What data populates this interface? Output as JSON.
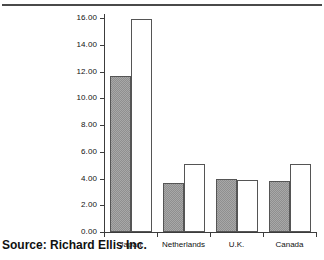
{
  "figure": {
    "caption": "Source: Richard Ellis Inc.",
    "top_rule_color": "#4a4a4a",
    "axis_color": "#3c3c3c"
  },
  "chart_data": {
    "type": "bar",
    "title": "",
    "subtitle": "",
    "xlabel": "",
    "ylabel": "",
    "categories": [
      "Japan",
      "Netherlands",
      "U.K.",
      "Canada"
    ],
    "series": [
      {
        "name": "series-a",
        "style": "gray-hatched",
        "color": "#a8a8a8",
        "values": [
          11.7,
          3.7,
          4.0,
          3.8
        ]
      },
      {
        "name": "series-b",
        "style": "white-outline",
        "color": "#ffffff",
        "values": [
          15.9,
          5.1,
          3.9,
          5.1
        ]
      }
    ],
    "ylim": [
      0,
      16
    ],
    "ytick_step": 2,
    "yticks": [
      0,
      2,
      4,
      6,
      8,
      10,
      12,
      14,
      16
    ],
    "ytick_labels": [
      "0.00",
      "2.00",
      "4.00",
      "6.00",
      "8.00",
      "10.00",
      "12.00",
      "14.00",
      "16.00"
    ],
    "grid": false,
    "legend": "none"
  }
}
